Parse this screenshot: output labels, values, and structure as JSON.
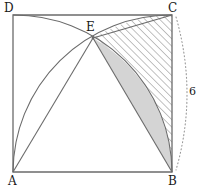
{
  "figure": {
    "type": "geometry-diagram",
    "width": 207,
    "height": 189,
    "background": "#ffffff",
    "stroke_color": "#6b6b6b",
    "label_color": "#1a1a1a",
    "shaded_fill": "#d4d4d4",
    "hatch_color": "#8a8a8a",
    "dotted_color": "#9a9a9a"
  },
  "labels": {
    "vertex_a": "A",
    "vertex_b": "B",
    "vertex_c": "C",
    "vertex_d": "D",
    "vertex_e": "E",
    "dimension_side": "6"
  },
  "points": {
    "A": {
      "x": 13,
      "y": 172
    },
    "B": {
      "x": 172,
      "y": 172
    },
    "C": {
      "x": 172,
      "y": 15
    },
    "D": {
      "x": 13,
      "y": 15
    },
    "E": {
      "x": 93,
      "y": 38
    }
  },
  "geometry": {
    "square_side_px": 158,
    "arc_radius_px": 158,
    "arc_from_A_center": "A",
    "arc_from_A_path": "D to E to B",
    "arc_from_B_center": "B",
    "arc_from_B_path": "A to E to C",
    "shaded_region": "lens between chord EB and arc EB centered at A",
    "hatched_region": "region bounded by arc EC, side CB and arc BE",
    "dimension_arc": "dotted arc outside side CB labelled 6"
  },
  "paths": {
    "square": "M13,172 L13,15 L172,15 L172,172 Z",
    "arc_D_E_B": "M13,15 A158,158 0 0 1 172,172",
    "arc_A_E_C": "M13,172 A158,158 0 0 1 172,15",
    "line_A_E": "M13,172 L93,38",
    "line_E_C": "M93,38 L172,15",
    "line_E_B": "M93,38 L172,172",
    "shaded_lens": "M93,38 L172,172 A158,158 0 0 0 93,38 Z",
    "hatched": "M93,38 A158,158 0 0 1 172,15 L172,172 A158,158 0 0 0 93,38 Z",
    "dim_arc": "M176,17 Q198,94 176,170"
  }
}
